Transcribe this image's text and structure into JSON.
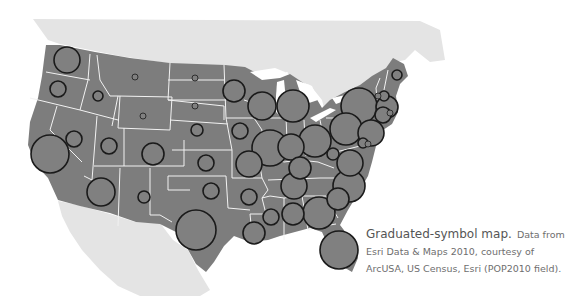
{
  "caption": {
    "title": "Graduated-symbol map.",
    "line1_rest": "Data from",
    "line2": "Esri Data & Maps 2010, courtesy of",
    "line3": "ArcUSA, US Census, Esri (POP2010 field)."
  },
  "colors": {
    "land_us": "#7d7d7d",
    "land_neighbors": "#e4e4e4",
    "state_borders": "#f2f2f2",
    "symbol_fill": "#808080",
    "symbol_stroke": "#1a1a1a",
    "water": "#ffffff"
  },
  "symbols": [
    {
      "state": "WA",
      "cx": 67,
      "cy": 60,
      "r": 13
    },
    {
      "state": "OR",
      "cx": 58,
      "cy": 89,
      "r": 8
    },
    {
      "state": "ID",
      "cx": 98,
      "cy": 96,
      "r": 5
    },
    {
      "state": "MT",
      "cx": 135,
      "cy": 77,
      "r": 3
    },
    {
      "state": "WY",
      "cx": 143,
      "cy": 116,
      "r": 3
    },
    {
      "state": "CA",
      "cx": 50,
      "cy": 154,
      "r": 19
    },
    {
      "state": "NV",
      "cx": 74,
      "cy": 139,
      "r": 8
    },
    {
      "state": "UT",
      "cx": 109,
      "cy": 146,
      "r": 8
    },
    {
      "state": "CO",
      "cx": 153,
      "cy": 154,
      "r": 11
    },
    {
      "state": "AZ",
      "cx": 101,
      "cy": 192,
      "r": 14
    },
    {
      "state": "NM",
      "cx": 144,
      "cy": 197,
      "r": 6
    },
    {
      "state": "ND",
      "cx": 195,
      "cy": 78,
      "r": 3
    },
    {
      "state": "SD",
      "cx": 195,
      "cy": 106,
      "r": 3
    },
    {
      "state": "NE",
      "cx": 197,
      "cy": 130,
      "r": 6
    },
    {
      "state": "KS",
      "cx": 206,
      "cy": 163,
      "r": 8
    },
    {
      "state": "OK",
      "cx": 211,
      "cy": 191,
      "r": 8
    },
    {
      "state": "TX",
      "cx": 196,
      "cy": 230,
      "r": 20
    },
    {
      "state": "MN",
      "cx": 234,
      "cy": 91,
      "r": 11
    },
    {
      "state": "IA",
      "cx": 240,
      "cy": 131,
      "r": 8
    },
    {
      "state": "MO",
      "cx": 249,
      "cy": 164,
      "r": 13
    },
    {
      "state": "AR",
      "cx": 249,
      "cy": 197,
      "r": 8
    },
    {
      "state": "LA",
      "cx": 254,
      "cy": 233,
      "r": 11
    },
    {
      "state": "WI",
      "cx": 262,
      "cy": 106,
      "r": 14
    },
    {
      "state": "IL",
      "cx": 270,
      "cy": 148,
      "r": 18
    },
    {
      "state": "MI",
      "cx": 293,
      "cy": 106,
      "r": 16
    },
    {
      "state": "IN",
      "cx": 291,
      "cy": 147,
      "r": 13
    },
    {
      "state": "KY",
      "cx": 300,
      "cy": 168,
      "r": 11
    },
    {
      "state": "TN",
      "cx": 294,
      "cy": 186,
      "r": 13
    },
    {
      "state": "MS",
      "cx": 271,
      "cy": 217,
      "r": 8
    },
    {
      "state": "AL",
      "cx": 293,
      "cy": 214,
      "r": 11
    },
    {
      "state": "OH",
      "cx": 315,
      "cy": 141,
      "r": 16
    },
    {
      "state": "WV",
      "cx": 333,
      "cy": 154,
      "r": 6
    },
    {
      "state": "GA",
      "cx": 319,
      "cy": 213,
      "r": 16
    },
    {
      "state": "FL",
      "cx": 339,
      "cy": 250,
      "r": 19
    },
    {
      "state": "SC",
      "cx": 338,
      "cy": 199,
      "r": 11
    },
    {
      "state": "NC",
      "cx": 349,
      "cy": 186,
      "r": 16
    },
    {
      "state": "VA",
      "cx": 350,
      "cy": 163,
      "r": 13
    },
    {
      "state": "PA",
      "cx": 346,
      "cy": 129,
      "r": 16
    },
    {
      "state": "NY",
      "cx": 359,
      "cy": 106,
      "r": 18
    },
    {
      "state": "NJ",
      "cx": 371,
      "cy": 133,
      "r": 13
    },
    {
      "state": "MD",
      "cx": 363,
      "cy": 143,
      "r": 5
    },
    {
      "state": "DE",
      "cx": 368,
      "cy": 144,
      "r": 3
    },
    {
      "state": "MA",
      "cx": 387,
      "cy": 107,
      "r": 11
    },
    {
      "state": "CT",
      "cx": 383,
      "cy": 115,
      "r": 8
    },
    {
      "state": "RI",
      "cx": 390,
      "cy": 113,
      "r": 3
    },
    {
      "state": "NH",
      "cx": 384,
      "cy": 96,
      "r": 5
    },
    {
      "state": "VT",
      "cx": 378,
      "cy": 96,
      "r": 3
    },
    {
      "state": "ME",
      "cx": 397,
      "cy": 75,
      "r": 5
    }
  ]
}
